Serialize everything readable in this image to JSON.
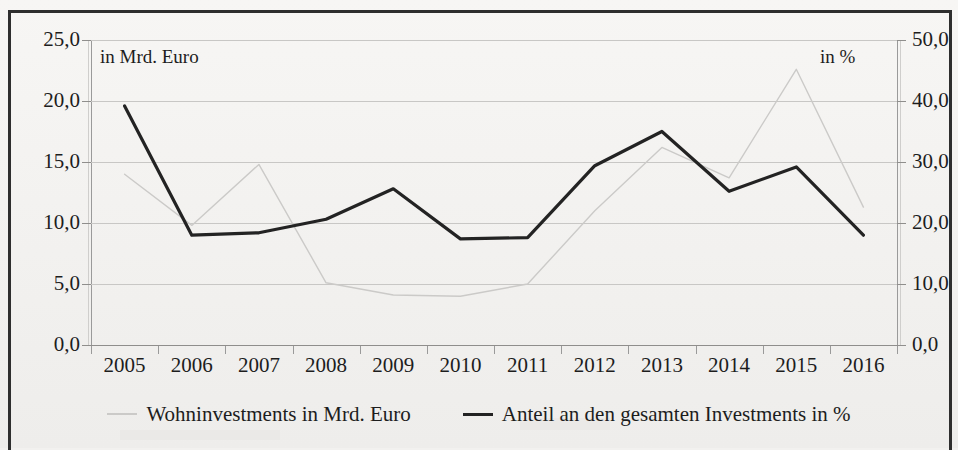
{
  "chart_data": {
    "type": "line",
    "title": "",
    "subtitle": "",
    "xlabel": "",
    "ylabel": "in Mrd. Euro",
    "y2label": "in %",
    "unit_left": "in Mrd. Euro",
    "unit_right": "in %",
    "grid": true,
    "legend_position": "bottom",
    "categories": [
      "2005",
      "2006",
      "2007",
      "2008",
      "2009",
      "2010",
      "2011",
      "2012",
      "2013",
      "2014",
      "2015",
      "2016"
    ],
    "ylim": [
      0,
      25
    ],
    "y2lim": [
      0,
      50
    ],
    "yticks": [
      "0,0",
      "5,0",
      "10,0",
      "15,0",
      "20,0",
      "25,0"
    ],
    "ytick_values": [
      0,
      5,
      10,
      15,
      20,
      25
    ],
    "y2ticks": [
      "0,0",
      "10,0",
      "20,0",
      "30,0",
      "40,0",
      "50,0"
    ],
    "y2tick_values": [
      0,
      10,
      20,
      30,
      40,
      50
    ],
    "series": [
      {
        "name": "Wohninvestments in Mrd. Euro",
        "axis": "left",
        "color": "#cbcac8",
        "values": [
          14.0,
          9.8,
          14.8,
          5.1,
          4.1,
          4.0,
          5.0,
          11.0,
          16.2,
          13.7,
          22.6,
          11.3
        ]
      },
      {
        "name": "Anteil an den gesamten Investments in %",
        "axis": "right",
        "color": "#232323",
        "values": [
          39.2,
          18.0,
          18.4,
          20.6,
          25.6,
          17.4,
          17.6,
          29.4,
          35.0,
          25.2,
          29.2,
          18.0
        ]
      }
    ]
  },
  "legend": {
    "items": [
      {
        "label": "Wohninvestments in Mrd. Euro",
        "style": "grey"
      },
      {
        "label": "Anteil an den gesamten Investments in %",
        "style": "black"
      }
    ]
  }
}
